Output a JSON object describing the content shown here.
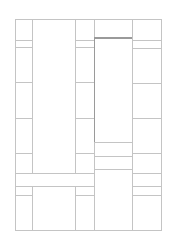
{
  "diagram": {
    "type": "floor-plan-wireframe",
    "width": 170,
    "height": 248,
    "colors": {
      "background": "#ffffff",
      "line": "#c4c4c4",
      "emphasis_line": "#9a9a9a"
    },
    "frame": {
      "x": 15,
      "y": 19,
      "w": 146,
      "h": 211
    },
    "cells": [
      {
        "id": "c1-r1",
        "x": 15,
        "y": 19,
        "w": 17,
        "h": 21
      },
      {
        "id": "c1-r2",
        "x": 15,
        "y": 40,
        "w": 17,
        "h": 7
      },
      {
        "id": "c1-r3",
        "x": 15,
        "y": 47,
        "w": 17,
        "h": 35
      },
      {
        "id": "c1-r4",
        "x": 15,
        "y": 82,
        "w": 17,
        "h": 36
      },
      {
        "id": "c1-r5",
        "x": 15,
        "y": 118,
        "w": 17,
        "h": 35
      },
      {
        "id": "c1-r6",
        "x": 15,
        "y": 153,
        "w": 17,
        "h": 20
      },
      {
        "id": "band-left",
        "x": 15,
        "y": 173,
        "w": 79,
        "h": 13
      },
      {
        "id": "c1-r8",
        "x": 15,
        "y": 186,
        "w": 17,
        "h": 9
      },
      {
        "id": "c1-r9",
        "x": 15,
        "y": 195,
        "w": 17,
        "h": 35
      },
      {
        "id": "c2-top",
        "x": 32,
        "y": 19,
        "w": 43,
        "h": 154
      },
      {
        "id": "c2-bottom",
        "x": 32,
        "y": 186,
        "w": 43,
        "h": 44
      },
      {
        "id": "c3-r1",
        "x": 75,
        "y": 19,
        "w": 19,
        "h": 21
      },
      {
        "id": "c3-r2",
        "x": 75,
        "y": 40,
        "w": 19,
        "h": 7
      },
      {
        "id": "c3-r3",
        "x": 75,
        "y": 47,
        "w": 19,
        "h": 35
      },
      {
        "id": "c3-r4",
        "x": 75,
        "y": 82,
        "w": 19,
        "h": 36
      },
      {
        "id": "c3-r5",
        "x": 75,
        "y": 118,
        "w": 19,
        "h": 35
      },
      {
        "id": "c3-r6",
        "x": 75,
        "y": 153,
        "w": 19,
        "h": 20
      },
      {
        "id": "c3-r8",
        "x": 75,
        "y": 186,
        "w": 19,
        "h": 9
      },
      {
        "id": "c3-r9",
        "x": 75,
        "y": 195,
        "w": 19,
        "h": 35
      },
      {
        "id": "c4-top",
        "x": 94,
        "y": 19,
        "w": 38,
        "h": 18
      },
      {
        "id": "c4-highlight",
        "x": 94,
        "y": 37,
        "w": 38,
        "h": 105,
        "emphasis": true
      },
      {
        "id": "c4-r3",
        "x": 94,
        "y": 142,
        "w": 38,
        "h": 14
      },
      {
        "id": "c4-r4",
        "x": 94,
        "y": 156,
        "w": 38,
        "h": 13
      },
      {
        "id": "c4-r5",
        "x": 94,
        "y": 169,
        "w": 38,
        "h": 61
      },
      {
        "id": "c5-r1",
        "x": 132,
        "y": 19,
        "w": 29,
        "h": 21
      },
      {
        "id": "c5-r2",
        "x": 132,
        "y": 40,
        "w": 29,
        "h": 8
      },
      {
        "id": "c5-r3",
        "x": 132,
        "y": 48,
        "w": 29,
        "h": 35
      },
      {
        "id": "c5-r4",
        "x": 132,
        "y": 83,
        "w": 29,
        "h": 35
      },
      {
        "id": "c5-r5",
        "x": 132,
        "y": 118,
        "w": 29,
        "h": 35
      },
      {
        "id": "c5-r6",
        "x": 132,
        "y": 153,
        "w": 29,
        "h": 20
      },
      {
        "id": "c5-r7",
        "x": 132,
        "y": 173,
        "w": 29,
        "h": 13
      },
      {
        "id": "c5-r8",
        "x": 132,
        "y": 186,
        "w": 29,
        "h": 9
      },
      {
        "id": "c5-r9",
        "x": 132,
        "y": 195,
        "w": 29,
        "h": 35
      }
    ]
  }
}
